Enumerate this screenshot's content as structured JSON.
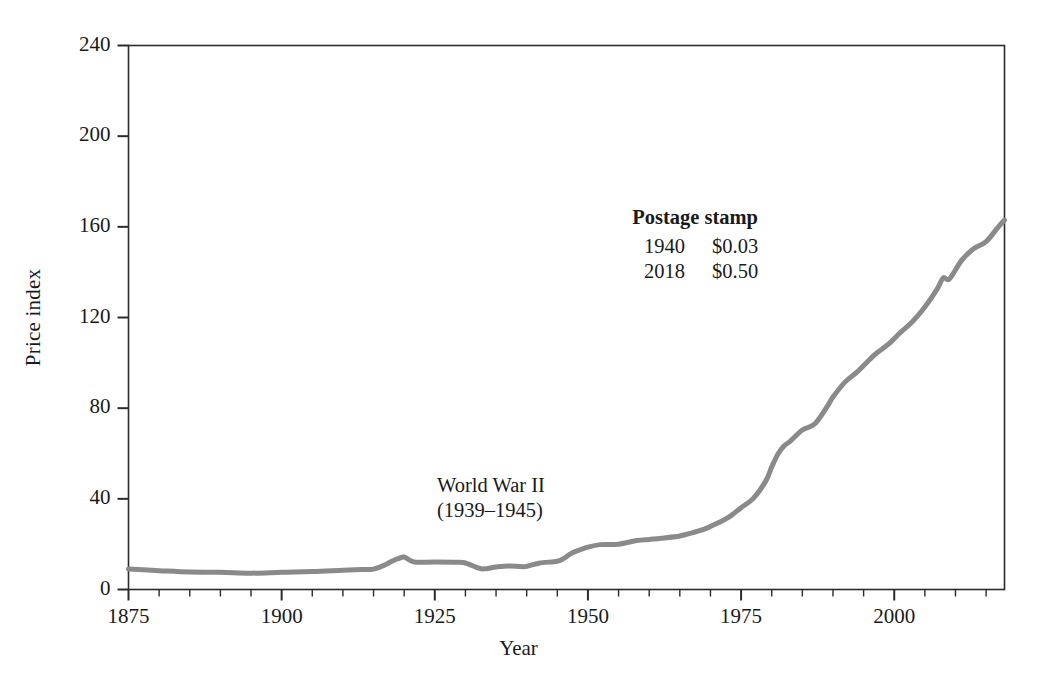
{
  "chart_data": {
    "type": "line",
    "title": "",
    "xlabel": "Year",
    "ylabel": "Price index",
    "xlim": [
      1875,
      2018
    ],
    "ylim": [
      0,
      240
    ],
    "grid": false,
    "legend": null,
    "line_color": "#8a8a8a",
    "line_width": 5,
    "xticks": [
      1875,
      1900,
      1925,
      1950,
      1975,
      2000
    ],
    "xtick_labels": [
      "1875",
      "1900",
      "1925",
      "1950",
      "1975",
      "2000"
    ],
    "xminor_step": 5,
    "yticks": [
      0,
      40,
      80,
      120,
      160,
      200,
      240
    ],
    "ytick_labels": [
      "0",
      "40",
      "80",
      "120",
      "160",
      "200",
      "240"
    ],
    "series": [
      {
        "name": "Price index",
        "x": [
          1875,
          1880,
          1885,
          1890,
          1895,
          1900,
          1905,
          1910,
          1913,
          1915,
          1917,
          1918,
          1919,
          1920,
          1921,
          1922,
          1925,
          1929,
          1930,
          1931,
          1932,
          1933,
          1935,
          1937,
          1939,
          1940,
          1942,
          1945,
          1946,
          1947,
          1948,
          1950,
          1952,
          1955,
          1958,
          1960,
          1962,
          1965,
          1967,
          1969,
          1971,
          1973,
          1975,
          1977,
          1979,
          1980,
          1981,
          1982,
          1983,
          1985,
          1987,
          1989,
          1990,
          1992,
          1994,
          1996,
          1997,
          1999,
          2001,
          2003,
          2005,
          2007,
          2008,
          2009,
          2011,
          2013,
          2015,
          2017,
          2018
        ],
        "y": [
          9.0,
          8.3,
          7.7,
          7.6,
          7.2,
          7.6,
          7.9,
          8.5,
          8.8,
          9.0,
          11.0,
          12.5,
          13.6,
          14.3,
          12.8,
          12.0,
          12.1,
          12.0,
          11.7,
          10.7,
          9.6,
          9.1,
          9.9,
          10.4,
          10.1,
          10.2,
          11.6,
          12.5,
          13.6,
          15.5,
          16.8,
          18.7,
          19.8,
          20.0,
          21.6,
          22.1,
          22.6,
          23.6,
          25.0,
          26.6,
          29.1,
          31.9,
          36.1,
          40.2,
          47.7,
          54.1,
          59.7,
          63.3,
          65.4,
          70.4,
          73.0,
          80.5,
          84.9,
          91.6,
          96.1,
          101.5,
          104.0,
          108.1,
          113.4,
          118.2,
          124.6,
          132.5,
          137.5,
          137.0,
          145.2,
          150.4,
          153.5,
          160.0,
          163.0
        ]
      }
    ],
    "annotations": [
      {
        "id": "world-war-2",
        "lines": [
          "World War II",
          "(1939–1945)"
        ],
        "bold": false
      },
      {
        "id": "postage-stamp",
        "title": "Postage stamp",
        "rows": [
          {
            "year": "1940",
            "price": "$0.03"
          },
          {
            "year": "2018",
            "price": "$0.50"
          }
        ]
      }
    ]
  },
  "axes": {
    "ylabel": "Price index",
    "xlabel": "Year",
    "ytick_labels": [
      "240",
      "200",
      "160",
      "120",
      "80",
      "40",
      "0"
    ],
    "xtick_labels": [
      "1875",
      "1900",
      "1925",
      "1950",
      "1975",
      "2000"
    ]
  },
  "annotations": {
    "war": {
      "line1": "World War II",
      "line2": "(1939–1945)"
    },
    "stamp": {
      "title": "Postage stamp",
      "row1_year": "1940",
      "row1_price": "$0.03",
      "row2_year": "2018",
      "row2_price": "$0.50"
    }
  },
  "colors": {
    "line": "#8a8a8a",
    "axis": "#2b2b2b",
    "text": "#1a1a1a",
    "background": "#ffffff"
  }
}
